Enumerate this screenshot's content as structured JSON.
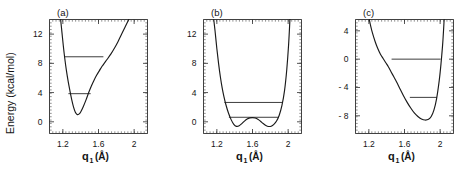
{
  "figure": {
    "ylabel": "Energy  (kcal/mol)",
    "xlabel_main": "q",
    "xlabel_sub": "1",
    "xlabel_unit": "(Å)"
  },
  "chart_data": [
    {
      "type": "line",
      "panel": "(a)",
      "title": "",
      "xlabel": "q1 (Å)",
      "ylabel": "Energy (kcal/mol)",
      "xlim": [
        1.05,
        2.15
      ],
      "ylim": [
        -1.6,
        14.0
      ],
      "xticks": [
        1.2,
        1.6,
        2
      ],
      "xticklabels": [
        "1.2",
        "1.6",
        "2"
      ],
      "yticks": [
        0,
        4,
        8,
        12
      ],
      "yticklabels": [
        "0",
        "4",
        "8",
        "12"
      ],
      "grid": false,
      "legend": false,
      "description": "Single anharmonic well, minimum near q1 = 1.35 A at about 1.0 kcal/mol, steep inner wall, shallow outer shoulder rising to the right.",
      "curve": {
        "name": "potential-a",
        "x": [
          1.175,
          1.19,
          1.205,
          1.22,
          1.24,
          1.26,
          1.28,
          1.3,
          1.32,
          1.34,
          1.36,
          1.38,
          1.4,
          1.43,
          1.46,
          1.49,
          1.52,
          1.55,
          1.58,
          1.61,
          1.64,
          1.67,
          1.7,
          1.74,
          1.78,
          1.82,
          1.86,
          1.9,
          1.94
        ],
        "y": [
          14.0,
          12.2,
          10.4,
          8.8,
          7.0,
          5.5,
          4.2,
          3.0,
          2.0,
          1.3,
          1.0,
          1.05,
          1.35,
          2.1,
          3.0,
          4.0,
          4.9,
          5.7,
          6.4,
          7.0,
          7.6,
          8.1,
          8.6,
          9.3,
          10.1,
          11.0,
          12.0,
          13.0,
          14.0
        ]
      },
      "levels": [
        {
          "name": "level-upper",
          "energy": 8.9,
          "x_left": 1.218,
          "x_right": 1.655
        },
        {
          "name": "level-lower",
          "energy": 3.85,
          "x_left": 1.262,
          "x_right": 1.512
        }
      ]
    },
    {
      "type": "line",
      "panel": "(b)",
      "title": "",
      "xlabel": "q1 (Å)",
      "ylabel": "Energy (kcal/mol)",
      "xlim": [
        1.05,
        2.15
      ],
      "ylim": [
        -1.6,
        14.0
      ],
      "xticks": [
        1.2,
        1.6,
        2
      ],
      "xticklabels": [
        "1.2",
        "1.6",
        "2"
      ],
      "yticks": [
        0,
        4,
        8,
        12
      ],
      "yticklabels": [
        "0",
        "4",
        "8",
        "12"
      ],
      "grid": false,
      "legend": false,
      "description": "Symmetric double well with central barrier at q1 = 1.6 A reaching about 0.55 kcal/mol; two equivalent minima near q1 = 1.41 and 1.79 A at about -0.65 kcal/mol.",
      "curve": {
        "name": "potential-b",
        "x": [
          1.165,
          1.18,
          1.2,
          1.22,
          1.24,
          1.26,
          1.28,
          1.3,
          1.33,
          1.36,
          1.39,
          1.42,
          1.45,
          1.48,
          1.51,
          1.54,
          1.57,
          1.6,
          1.63,
          1.66,
          1.69,
          1.72,
          1.75,
          1.78,
          1.81,
          1.84,
          1.87,
          1.9,
          1.93,
          1.96,
          1.985,
          2.005,
          2.02
        ],
        "y": [
          14.0,
          12.4,
          10.0,
          7.9,
          6.1,
          4.6,
          3.4,
          2.4,
          1.2,
          0.3,
          -0.35,
          -0.62,
          -0.55,
          -0.25,
          0.1,
          0.38,
          0.53,
          0.57,
          0.52,
          0.36,
          0.08,
          -0.24,
          -0.5,
          -0.64,
          -0.6,
          -0.35,
          0.1,
          0.9,
          2.2,
          4.3,
          7.2,
          10.5,
          14.0
        ]
      },
      "levels": [
        {
          "name": "level-upper",
          "energy": 2.65,
          "x_left": 1.285,
          "x_right": 1.935
        },
        {
          "name": "level-lower",
          "energy": 0.62,
          "x_left": 1.335,
          "x_right": 1.895
        }
      ]
    },
    {
      "type": "line",
      "panel": "(c)",
      "title": "",
      "xlabel": "q1 (Å)",
      "ylabel": "Energy (kcal/mol)",
      "xlim": [
        1.05,
        2.15
      ],
      "ylim": [
        -10.5,
        5.6
      ],
      "xticks": [
        1.2,
        1.6,
        2
      ],
      "xticklabels": [
        "1.2",
        "1.6",
        "2"
      ],
      "yticks": [
        4,
        0,
        -4,
        -8
      ],
      "yticklabels": [
        "4",
        "0",
        "- 4",
        "- 8"
      ],
      "grid": false,
      "legend": false,
      "description": "Deep asymmetric well, minimum near q1 = 1.88 A at about -8.6 kcal/mol, with a pronounced shoulder on the repulsive inner branch near q1 = 1.45 A and a very steep outer wall.",
      "curve": {
        "name": "potential-c",
        "x": [
          1.205,
          1.22,
          1.24,
          1.27,
          1.3,
          1.33,
          1.36,
          1.39,
          1.42,
          1.45,
          1.48,
          1.51,
          1.55,
          1.59,
          1.63,
          1.67,
          1.71,
          1.75,
          1.79,
          1.83,
          1.87,
          1.9,
          1.93,
          1.96,
          1.99,
          2.01,
          2.03,
          2.045
        ],
        "y": [
          5.6,
          4.7,
          3.7,
          2.5,
          1.5,
          0.7,
          0.1,
          -0.5,
          -1.1,
          -1.8,
          -2.5,
          -3.2,
          -4.2,
          -5.2,
          -6.1,
          -6.9,
          -7.6,
          -8.1,
          -8.45,
          -8.6,
          -8.5,
          -8.1,
          -7.2,
          -5.6,
          -3.0,
          -0.6,
          2.4,
          5.6
        ]
      },
      "levels": [
        {
          "name": "level-upper",
          "energy": 0.0,
          "x_left": 1.455,
          "x_right": 2.005
        },
        {
          "name": "level-lower",
          "energy": -5.4,
          "x_left": 1.66,
          "x_right": 1.965
        }
      ]
    }
  ]
}
